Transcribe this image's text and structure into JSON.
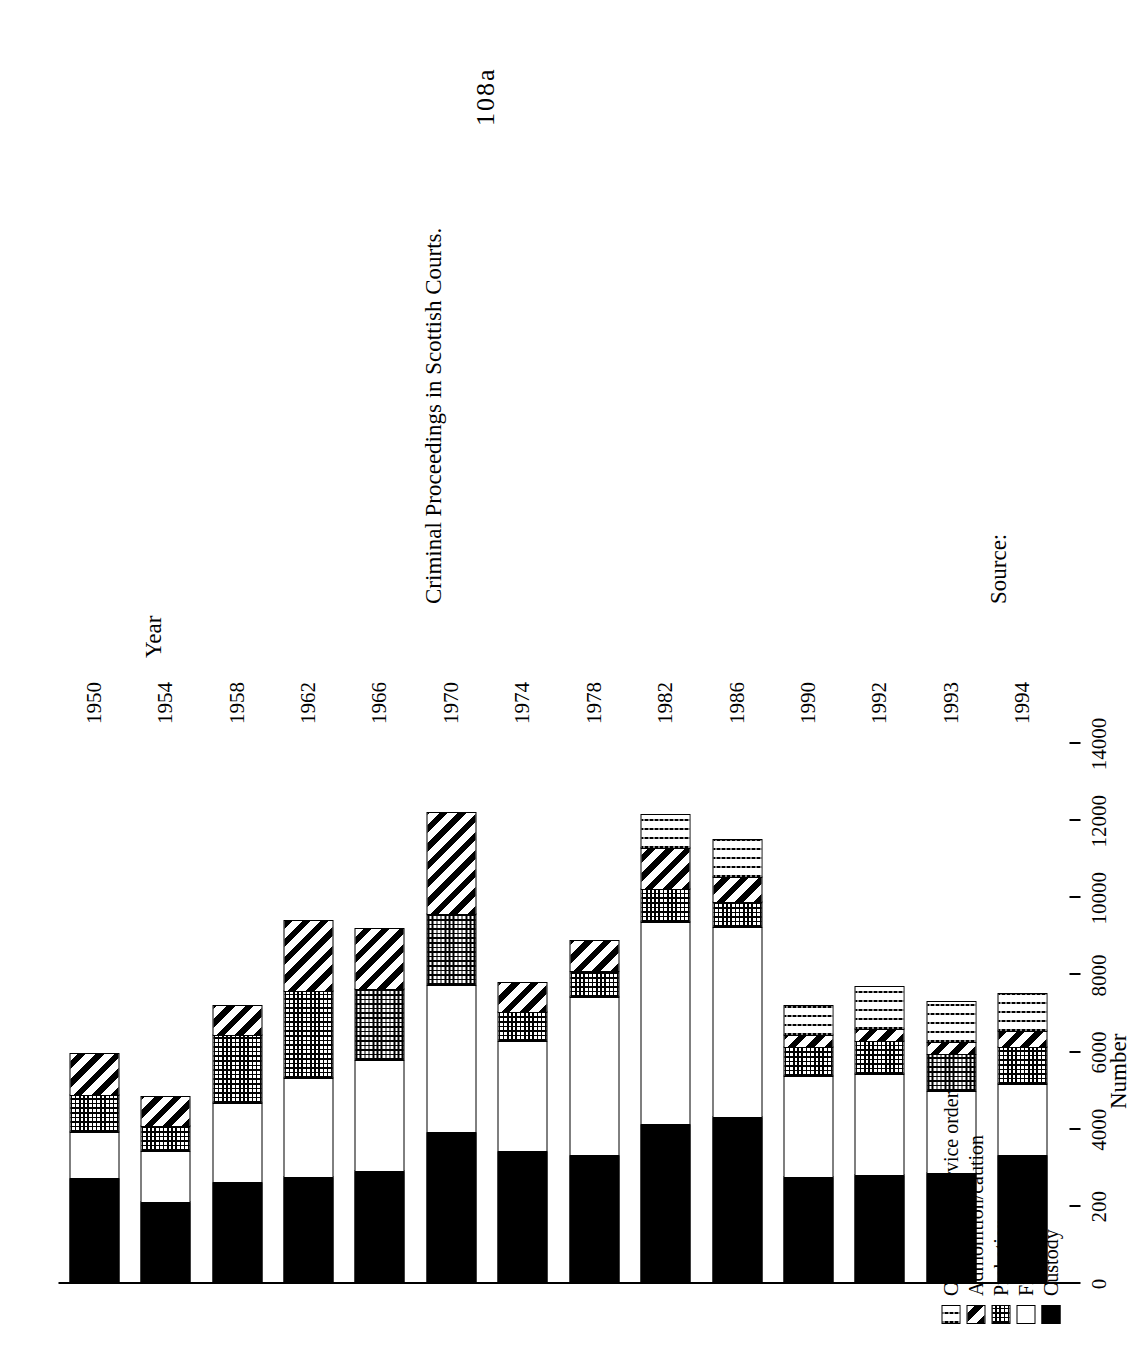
{
  "page": {
    "page_number": "108a"
  },
  "chart_data": {
    "type": "bar",
    "orientation": "horizontal-rotated",
    "stacked": true,
    "title": "",
    "xlabel": "Year",
    "ylabel": "Number",
    "ylim": [
      0,
      14000
    ],
    "grid": false,
    "legend_position": "left",
    "ytick_labels": [
      "14000",
      "12000",
      "10000",
      "8000",
      "6000",
      "4000",
      "200",
      "0"
    ],
    "ytick_values": [
      14000,
      12000,
      10000,
      8000,
      6000,
      4000,
      2000,
      0
    ],
    "categories": [
      "1950",
      "1954",
      "1958",
      "1962",
      "1966",
      "1970",
      "1974",
      "1978",
      "1982",
      "1986",
      "1990",
      "1992",
      "1993",
      "1994"
    ],
    "series": [
      {
        "name": "Custody",
        "pattern": "solid-black",
        "values": [
          2700,
          2100,
          2600,
          2750,
          2900,
          3900,
          3400,
          3300,
          4100,
          4300,
          2750,
          2800,
          2850,
          3300
        ]
      },
      {
        "name": "Fine",
        "pattern": "white",
        "values": [
          1250,
          1350,
          2100,
          2600,
          2900,
          3850,
          2900,
          4150,
          5300,
          4950,
          2650,
          2650,
          2150,
          1900
        ]
      },
      {
        "name": "Probation",
        "pattern": "dotted-grid",
        "values": [
          1000,
          700,
          1800,
          2300,
          1900,
          1900,
          800,
          700,
          900,
          700,
          800,
          900,
          1000,
          1000
        ]
      },
      {
        "name": "Admonition/caution",
        "pattern": "diagonal-stripe",
        "values": [
          1100,
          800,
          800,
          1850,
          1600,
          2650,
          800,
          850,
          1100,
          700,
          350,
          350,
          350,
          450
        ]
      },
      {
        "name": "Community service order",
        "pattern": "wavy-lines",
        "values": [
          0,
          0,
          0,
          0,
          0,
          0,
          0,
          0,
          900,
          1000,
          800,
          1150,
          1100,
          1000
        ]
      }
    ],
    "totals": [
      6050,
      4950,
      7300,
      9500,
      9300,
      12300,
      7900,
      9000,
      12300,
      11650,
      7350,
      7850,
      7450,
      7650
    ]
  },
  "legend": {
    "items": [
      {
        "label": "Community service order",
        "swatch": "wavy-lines-swatch"
      },
      {
        "label": "Admonition/caution",
        "swatch": "diagonal-stripe-swatch"
      },
      {
        "label": "Probation",
        "swatch": "dotted-grid-swatch"
      },
      {
        "label": "Fine",
        "swatch": "white-swatch"
      },
      {
        "label": "Custody",
        "swatch": "solid-black-swatch"
      }
    ]
  },
  "source": {
    "label": "Source:",
    "text": "Criminal Proceedings in Scottish Courts."
  }
}
